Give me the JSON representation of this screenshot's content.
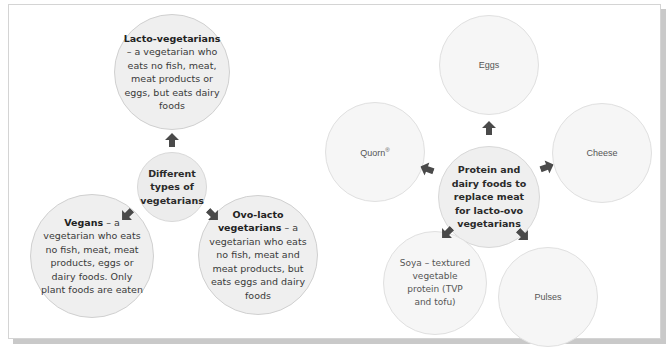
{
  "left_diagram": {
    "hub": {
      "label": "Different types of vegetarians"
    },
    "nodes": [
      {
        "id": "lacto",
        "term": "Lacto-vegetarians",
        "definition": " – a vegetarian who eats no fish, meat, meat products or eggs, but eats dairy foods"
      },
      {
        "id": "vegans",
        "term": "Vegans",
        "definition": " – a vegetarian who eats no fish, meat, meat products, eggs or dairy foods. Only plant foods are eaten"
      },
      {
        "id": "ovo-lacto",
        "term": "Ovo-lacto vegetarians",
        "definition": " – a vegetarian who eats no fish, meat and meat products, but eats eggs and dairy foods"
      }
    ]
  },
  "right_diagram": {
    "hub": {
      "label": "Protein and dairy foods to replace meat for lacto-ovo vegetarians"
    },
    "nodes": [
      {
        "id": "eggs",
        "label": "Eggs"
      },
      {
        "id": "quorn",
        "label": "Quorn",
        "sup": "®"
      },
      {
        "id": "cheese",
        "label": "Cheese"
      },
      {
        "id": "soya",
        "label": "Soya – textured vegetable protein (TVP and tofu)"
      },
      {
        "id": "pulses",
        "label": "Pulses"
      }
    ]
  },
  "icons": {
    "arrow": "arrow-icon"
  },
  "colors": {
    "circle_fill": "#efefef",
    "circle_border": "#d0d0d0",
    "arrow": "#4a4a4a",
    "frame_shadow": "#c9c9c9"
  }
}
